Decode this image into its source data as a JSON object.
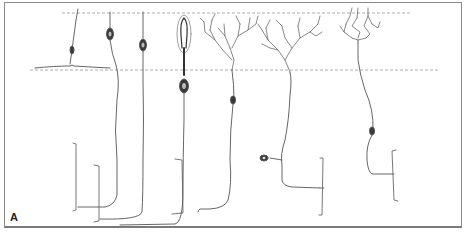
{
  "figure": {
    "panel_label": "A",
    "colors": {
      "frame": "#8a8a8a",
      "dashed_lines": "#9a9a9a",
      "neuron_stroke": "#555555",
      "soma_fill": "#3a3a3a"
    },
    "layer_lines": [
      {
        "name": "upper-boundary",
        "y": 13,
        "x_start": 62,
        "x_end": 412
      },
      {
        "name": "lower-boundary",
        "y": 70,
        "x_start": 30,
        "x_end": 440
      }
    ],
    "cells": [
      {
        "id": "cell-1",
        "type": "horizontal-cell-like",
        "x": 72
      },
      {
        "id": "cell-2",
        "type": "rod-photoreceptor",
        "x": 110
      },
      {
        "id": "cell-3",
        "type": "rod-photoreceptor",
        "x": 143
      },
      {
        "id": "cell-4",
        "type": "cone-photoreceptor",
        "x": 184
      },
      {
        "id": "cell-5",
        "type": "bipolar-cell-dendritic",
        "x": 232
      },
      {
        "id": "cell-6",
        "type": "bipolar-cell-dendritic",
        "x": 290
      },
      {
        "id": "cell-7",
        "type": "bipolar-cell-dendritic",
        "x": 358
      }
    ]
  }
}
